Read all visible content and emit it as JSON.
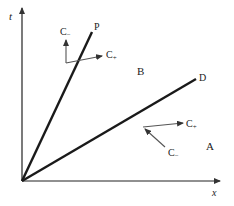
{
  "diagram": {
    "axes": {
      "vertical_label": "t",
      "horizontal_label": "x"
    },
    "lines": [
      {
        "id": "P",
        "label": "P"
      },
      {
        "id": "D",
        "label": "D"
      }
    ],
    "regions": [
      {
        "id": "B",
        "label": "B"
      },
      {
        "id": "A",
        "label": "A"
      }
    ],
    "characteristics": {
      "on_P": {
        "c_minus": {
          "base": "C",
          "sub": "−"
        },
        "c_plus": {
          "base": "C",
          "sub": "+"
        }
      },
      "on_D": {
        "c_plus": {
          "base": "C",
          "sub": "+"
        },
        "c_minus": {
          "base": "C",
          "sub": "−"
        }
      }
    },
    "colors": {
      "axis": "#222222",
      "line": "#1a1a1a",
      "arrow": "#555555"
    }
  }
}
